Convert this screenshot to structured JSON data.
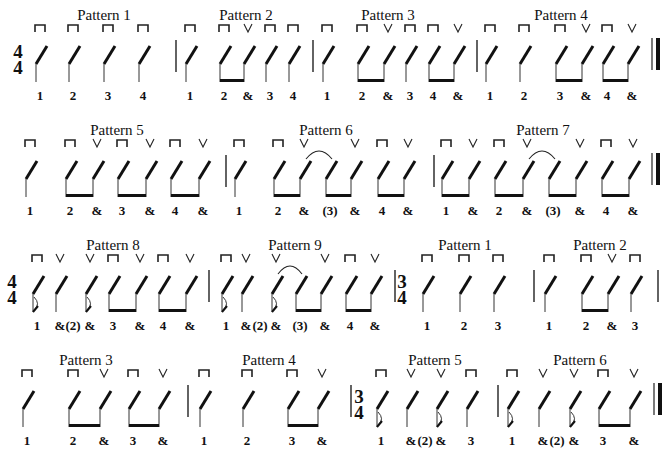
{
  "legend": {
    "downstroke_symbol": "⊓",
    "upstroke_symbol": "V"
  },
  "rows": [
    {
      "y": 0,
      "time_signature": {
        "top": "4",
        "bottom": "4",
        "x": 18
      },
      "patterns": [
        {
          "title": "Pattern 1",
          "title_x": 104,
          "beats": [
            {
              "x": 40,
              "count": "1",
              "stroke": "down",
              "beam": false
            },
            {
              "x": 73,
              "count": "2",
              "stroke": "down"
            },
            {
              "x": 108,
              "count": "3",
              "stroke": "down"
            },
            {
              "x": 143,
              "count": "4",
              "stroke": "down"
            }
          ],
          "beams": []
        },
        {
          "title": "Pattern 2",
          "title_x": 246,
          "beats": [
            {
              "x": 190,
              "count": "1",
              "stroke": "down"
            },
            {
              "x": 224,
              "count": "2",
              "stroke": "down"
            },
            {
              "x": 248,
              "count": "&",
              "stroke": "up"
            },
            {
              "x": 270,
              "count": "3",
              "stroke": "down"
            },
            {
              "x": 293,
              "count": "4",
              "stroke": "down"
            }
          ],
          "beams": [
            [
              224,
              248
            ]
          ]
        },
        {
          "title": "Pattern 3",
          "title_x": 388,
          "beats": [
            {
              "x": 327,
              "count": "1",
              "stroke": "down"
            },
            {
              "x": 362,
              "count": "2",
              "stroke": "down"
            },
            {
              "x": 388,
              "count": "&",
              "stroke": "up"
            },
            {
              "x": 410,
              "count": "3",
              "stroke": "down"
            },
            {
              "x": 433,
              "count": "4",
              "stroke": "down"
            },
            {
              "x": 458,
              "count": "&",
              "stroke": "up"
            }
          ],
          "beams": [
            [
              362,
              388
            ],
            [
              433,
              458
            ]
          ]
        },
        {
          "title": "Pattern 4",
          "title_x": 561,
          "beats": [
            {
              "x": 490,
              "count": "1",
              "stroke": "down"
            },
            {
              "x": 524,
              "count": "2",
              "stroke": "down"
            },
            {
              "x": 560,
              "count": "3",
              "stroke": "down"
            },
            {
              "x": 586,
              "count": "&",
              "stroke": "up"
            },
            {
              "x": 607,
              "count": "4",
              "stroke": "down"
            },
            {
              "x": 632,
              "count": "&",
              "stroke": "up"
            }
          ],
          "beams": [
            [
              560,
              586
            ],
            [
              607,
              632
            ]
          ]
        }
      ],
      "barlines": [
        176,
        313,
        477
      ],
      "final_barline": 652
    },
    {
      "y": 115,
      "time_signature": null,
      "patterns": [
        {
          "title": "Pattern 5",
          "title_x": 117,
          "beats": [
            {
              "x": 30,
              "count": "1",
              "stroke": "down"
            },
            {
              "x": 70,
              "count": "2",
              "stroke": "down"
            },
            {
              "x": 97,
              "count": "&",
              "stroke": "up"
            },
            {
              "x": 122,
              "count": "3",
              "stroke": "down"
            },
            {
              "x": 150,
              "count": "&",
              "stroke": "up"
            },
            {
              "x": 175,
              "count": "4",
              "stroke": "down"
            },
            {
              "x": 203,
              "count": "&",
              "stroke": "up"
            }
          ],
          "beams": [
            [
              70,
              97
            ],
            [
              122,
              150
            ],
            [
              175,
              203
            ]
          ]
        },
        {
          "title": "Pattern 6",
          "title_x": 326,
          "beats": [
            {
              "x": 239,
              "count": "1",
              "stroke": "down"
            },
            {
              "x": 278,
              "count": "2",
              "stroke": "down"
            },
            {
              "x": 304,
              "count": "&",
              "stroke": "up"
            },
            {
              "x": 330,
              "count": "(3)",
              "stroke": "",
              "tied": true
            },
            {
              "x": 355,
              "count": "&",
              "stroke": "up"
            },
            {
              "x": 382,
              "count": "4",
              "stroke": "down"
            },
            {
              "x": 408,
              "count": "&",
              "stroke": "up"
            }
          ],
          "beams": [
            [
              278,
              304
            ],
            [
              330,
              355
            ],
            [
              382,
              408
            ]
          ],
          "ties": [
            [
              304,
              330
            ]
          ]
        },
        {
          "title": "Pattern 7",
          "title_x": 543,
          "beats": [
            {
              "x": 446,
              "count": "1",
              "stroke": "down"
            },
            {
              "x": 473,
              "count": "&",
              "stroke": "up"
            },
            {
              "x": 499,
              "count": "2",
              "stroke": "down"
            },
            {
              "x": 527,
              "count": "&",
              "stroke": "up"
            },
            {
              "x": 553,
              "count": "(3)",
              "stroke": "",
              "tied": true
            },
            {
              "x": 580,
              "count": "&",
              "stroke": "up"
            },
            {
              "x": 606,
              "count": "4",
              "stroke": "down"
            },
            {
              "x": 633,
              "count": "&",
              "stroke": "up"
            }
          ],
          "beams": [
            [
              446,
              473
            ],
            [
              499,
              527
            ],
            [
              553,
              580
            ],
            [
              606,
              633
            ]
          ],
          "ties": [
            [
              527,
              553
            ]
          ]
        }
      ],
      "barlines": [
        226,
        434
      ],
      "final_barline": 652
    },
    {
      "y": 230,
      "time_signature": {
        "top": "4",
        "bottom": "4",
        "x": 12
      },
      "patterns": [
        {
          "title": "Pattern 8",
          "title_x": 113,
          "beats": [
            {
              "x": 37,
              "count": "1",
              "stroke": "down",
              "dotted_tie": true
            },
            {
              "x": 60,
              "count": "&",
              "stroke": "up"
            },
            {
              "x": 73,
              "count": "(2)",
              "stroke": "",
              "count_only": true
            },
            {
              "x": 90,
              "count": "&",
              "stroke": "up",
              "dotted_tie": true
            },
            {
              "x": 113,
              "count": "3",
              "stroke": "down"
            },
            {
              "x": 140,
              "count": "&",
              "stroke": "up"
            },
            {
              "x": 163,
              "count": "4",
              "stroke": "down"
            },
            {
              "x": 190,
              "count": "&",
              "stroke": "up"
            }
          ],
          "beams": [
            [
              113,
              140
            ],
            [
              163,
              190
            ]
          ]
        },
        {
          "title": "Pattern 9",
          "title_x": 295,
          "beats": [
            {
              "x": 226,
              "count": "1",
              "stroke": "down",
              "dotted_tie": true
            },
            {
              "x": 246,
              "count": "&",
              "stroke": "up"
            },
            {
              "x": 260,
              "count": "(2)",
              "stroke": "",
              "count_only": true
            },
            {
              "x": 276,
              "count": "&",
              "stroke": "up",
              "dotted_tie": true
            },
            {
              "x": 300,
              "count": "(3)",
              "stroke": "",
              "tied": true
            },
            {
              "x": 325,
              "count": "&",
              "stroke": "up"
            },
            {
              "x": 350,
              "count": "4",
              "stroke": "down"
            },
            {
              "x": 375,
              "count": "&",
              "stroke": "up"
            }
          ],
          "beams": [
            [
              300,
              325
            ],
            [
              350,
              375
            ]
          ],
          "ties": [
            [
              276,
              300
            ]
          ]
        },
        {
          "title": "Pattern 1",
          "title_x": 465,
          "beats": [
            {
              "x": 427,
              "count": "1",
              "stroke": "down"
            },
            {
              "x": 464,
              "count": "2",
              "stroke": "down"
            },
            {
              "x": 498,
              "count": "3",
              "stroke": "down"
            }
          ],
          "beams": []
        },
        {
          "title": "Pattern 2",
          "title_x": 600,
          "beats": [
            {
              "x": 549,
              "count": "1",
              "stroke": "down"
            },
            {
              "x": 586,
              "count": "2",
              "stroke": "down"
            },
            {
              "x": 612,
              "count": "&",
              "stroke": "up"
            },
            {
              "x": 635,
              "count": "3",
              "stroke": "down"
            }
          ],
          "beams": [
            [
              586,
              612
            ]
          ]
        }
      ],
      "barlines": [
        209,
        534,
        658
      ],
      "time_signature_2": {
        "top": "3",
        "bottom": "4",
        "x": 402
      },
      "barline_before_ts2": 395
    },
    {
      "y": 345,
      "time_signature": null,
      "patterns": [
        {
          "title": "Pattern 3",
          "title_x": 86,
          "beats": [
            {
              "x": 27,
              "count": "1",
              "stroke": "down"
            },
            {
              "x": 73,
              "count": "2",
              "stroke": "down"
            },
            {
              "x": 104,
              "count": "&",
              "stroke": "up"
            },
            {
              "x": 133,
              "count": "3",
              "stroke": "down"
            },
            {
              "x": 163,
              "count": "&",
              "stroke": "up"
            }
          ],
          "beams": [
            [
              73,
              104
            ],
            [
              133,
              163
            ]
          ]
        },
        {
          "title": "Pattern 4",
          "title_x": 269,
          "beats": [
            {
              "x": 204,
              "count": "1",
              "stroke": "down"
            },
            {
              "x": 247,
              "count": "2",
              "stroke": "down"
            },
            {
              "x": 292,
              "count": "3",
              "stroke": "down"
            },
            {
              "x": 322,
              "count": "&",
              "stroke": "up"
            }
          ],
          "beams": [
            [
              292,
              322
            ]
          ]
        },
        {
          "title": "Pattern 5",
          "title_x": 435,
          "beats": [
            {
              "x": 381,
              "count": "1",
              "stroke": "down",
              "dotted_tie": true
            },
            {
              "x": 411,
              "count": "&",
              "stroke": "up"
            },
            {
              "x": 425,
              "count": "(2)",
              "stroke": "",
              "count_only": true
            },
            {
              "x": 441,
              "count": "&",
              "stroke": "up",
              "dotted_tie": true
            },
            {
              "x": 471,
              "count": "3",
              "stroke": "down"
            }
          ],
          "beams": []
        },
        {
          "title": "Pattern 6",
          "title_x": 580,
          "beats": [
            {
              "x": 512,
              "count": "1",
              "stroke": "down",
              "dotted_tie": true
            },
            {
              "x": 543,
              "count": "&",
              "stroke": "up"
            },
            {
              "x": 557,
              "count": "(2)",
              "stroke": "",
              "count_only": true
            },
            {
              "x": 574,
              "count": "&",
              "stroke": "up",
              "dotted_tie": true
            },
            {
              "x": 603,
              "count": "3",
              "stroke": "down"
            },
            {
              "x": 634,
              "count": "&",
              "stroke": "up"
            }
          ],
          "beams": [
            [
              603,
              634
            ]
          ]
        }
      ],
      "barlines": [
        188,
        498
      ],
      "time_signature_2": {
        "top": "3",
        "bottom": "4",
        "x": 359
      },
      "barline_before_ts2": 351,
      "final_barline": 654
    }
  ]
}
